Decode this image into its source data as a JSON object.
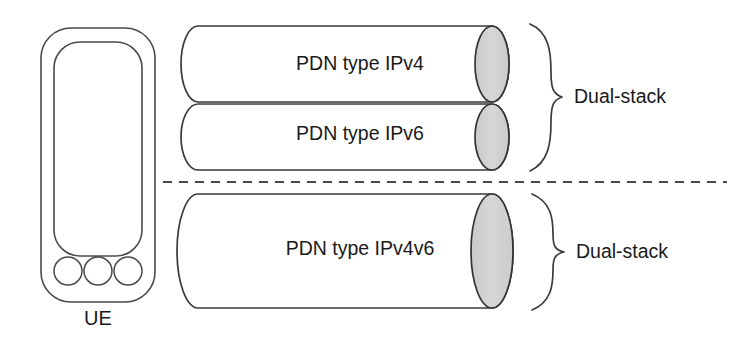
{
  "figure": {
    "background": "#ffffff",
    "stroke_color": "#3a3a3a",
    "cap_fill": "#d2d2d2"
  },
  "device": {
    "name": "user-equipment",
    "label": "UE",
    "keys": 3
  },
  "tubes": [
    {
      "id": "tube-ipv4",
      "label": "PDN type IPv4",
      "group": "top"
    },
    {
      "id": "tube-ipv6",
      "label": "PDN type IPv6",
      "group": "top"
    },
    {
      "id": "tube-ipv4v6",
      "label": "PDN type IPv4v6",
      "group": "bottom"
    }
  ],
  "braces": [
    {
      "id": "brace-top",
      "label": "Dual-stack"
    },
    {
      "id": "brace-bottom",
      "label": "Dual-stack"
    }
  ],
  "divider": {
    "id": "separator-dashed-line",
    "style": "dashed"
  }
}
